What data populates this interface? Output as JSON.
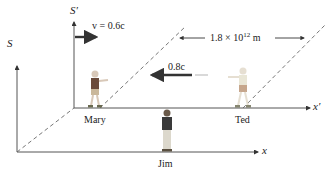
{
  "frames": {
    "S": {
      "label": "S",
      "axis_label": "x"
    },
    "S_prime": {
      "label": "S′",
      "axis_label": "x′"
    }
  },
  "velocity": {
    "label": "v = 0.6c",
    "value": "0.6c"
  },
  "light_signal": {
    "label": "0.8c"
  },
  "distance": {
    "label_prefix": "1.8 × 10",
    "exponent": "12",
    "unit": " m"
  },
  "people": [
    {
      "name": "Mary"
    },
    {
      "name": "Ted"
    },
    {
      "name": "Jim"
    }
  ],
  "colors": {
    "axis": "#555555",
    "arrow": "#333333",
    "dashed": "#666666",
    "text": "#222222"
  }
}
